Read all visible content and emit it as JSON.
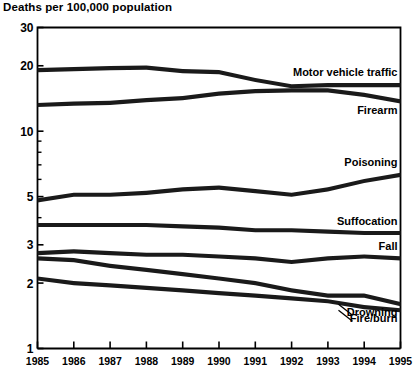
{
  "chart_data": {
    "type": "line",
    "title": "Deaths per 100,000 population",
    "xlabel": "",
    "ylabel": "Deaths per 100,000 population",
    "yscale": "log",
    "ylim": [
      1,
      30
    ],
    "grid": false,
    "legend_position": "right-inline-labels",
    "x": [
      1985,
      1986,
      1987,
      1988,
      1989,
      1990,
      1991,
      1992,
      1993,
      1994,
      1995
    ],
    "categories": [
      "1985",
      "1986",
      "1987",
      "1988",
      "1989",
      "1990",
      "1991",
      "1992",
      "1993",
      "1994",
      "1995"
    ],
    "ytick_labels": [
      "30",
      "20",
      "10",
      "5",
      "3",
      "2",
      "1"
    ],
    "ytick_values": [
      30,
      20,
      10,
      5,
      3,
      2,
      1
    ],
    "yminor_ticks": [
      9,
      8,
      7,
      6,
      4
    ],
    "series": [
      {
        "name": "Motor vehicle traffic",
        "values": [
          19.1,
          19.3,
          19.5,
          19.6,
          18.9,
          18.7,
          17.2,
          16.1,
          16.3,
          16.3,
          16.3
        ]
      },
      {
        "name": "Firearm",
        "values": [
          13.2,
          13.4,
          13.5,
          13.9,
          14.2,
          14.9,
          15.3,
          15.4,
          15.4,
          14.7,
          13.7
        ]
      },
      {
        "name": "Poisoning",
        "values": [
          4.8,
          5.1,
          5.1,
          5.2,
          5.4,
          5.5,
          5.3,
          5.1,
          5.4,
          5.9,
          6.3
        ]
      },
      {
        "name": "Suffocation",
        "values": [
          3.7,
          3.7,
          3.7,
          3.7,
          3.65,
          3.6,
          3.5,
          3.5,
          3.45,
          3.4,
          3.4
        ]
      },
      {
        "name": "Fall",
        "values": [
          2.75,
          2.8,
          2.75,
          2.7,
          2.7,
          2.65,
          2.6,
          2.5,
          2.6,
          2.65,
          2.6
        ]
      },
      {
        "name": "Drowning",
        "values": [
          2.6,
          2.55,
          2.4,
          2.3,
          2.2,
          2.1,
          2.0,
          1.85,
          1.75,
          1.75,
          1.6
        ]
      },
      {
        "name": "Fire/burn",
        "values": [
          2.1,
          2.0,
          1.95,
          1.9,
          1.85,
          1.8,
          1.75,
          1.7,
          1.65,
          1.55,
          1.5
        ]
      }
    ],
    "annotations": [
      {
        "text": "Motor vehicle traffic",
        "series": "Motor vehicle traffic"
      },
      {
        "text": "Firearm",
        "series": "Firearm"
      },
      {
        "text": "Poisoning",
        "series": "Poisoning"
      },
      {
        "text": "Suffocation",
        "series": "Suffocation"
      },
      {
        "text": "Fall",
        "series": "Fall"
      },
      {
        "text": "Drowning",
        "series": "Drowning"
      },
      {
        "text": "Fire/burn",
        "series": "Fire/burn"
      }
    ],
    "colors": {
      "line": "#1a1a1a",
      "axis": "#000000",
      "background": "#ffffff"
    }
  },
  "labels": {
    "motor_vehicle": "Motor vehicle traffic",
    "firearm": "Firearm",
    "poisoning": "Poisoning",
    "suffocation": "Suffocation",
    "fall": "Fall",
    "drowning": "Drowning",
    "fire_burn": "Fire/burn"
  }
}
